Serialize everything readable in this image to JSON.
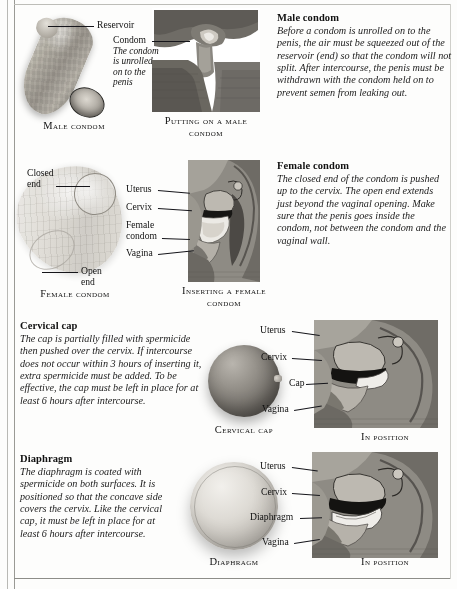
{
  "page": {
    "sections": [
      {
        "id": "male-condom",
        "heading": "Male condom",
        "body": "Before a condom is unrolled on to the penis, the air must be squeezed out of the reservoir (end) so that the condom will not split. After intercourse, the penis must be withdrawn with the condom held on to prevent semen from leaking out."
      },
      {
        "id": "female-condom",
        "heading": "Female condom",
        "body": "The closed end of the condom is pushed up to the cervix. The open end extends just beyond the vaginal opening. Make sure that the penis goes inside the condom, not between the condom and the vaginal wall."
      },
      {
        "id": "cervical-cap",
        "heading": "Cervical cap",
        "body": "The cap is partially filled with spermicide then pushed over the cervix. If intercourse does not occur within 3 hours of inserting it, extra spermicide must be added. To be effective, the cap must be left in place for at least 6 hours after intercourse."
      },
      {
        "id": "diaphragm",
        "heading": "Diaphragm",
        "body": "The diaphragm is coated with spermicide on both surfaces. It is positioned so that the concave side covers the cervix. Like the cervical cap, it must be left in place for at least 6 hours after intercourse."
      }
    ],
    "figure_captions": {
      "male_condom": "Male condom",
      "putting_on": "Putting on a male condom",
      "female_condom": "Female condom",
      "inserting_female": "Inserting a female condom",
      "cervical_cap": "Cervical cap",
      "cap_in_position": "In position",
      "diaphragm": "Diaphragm",
      "diaphragm_in_position": "In position"
    },
    "callouts": {
      "reservoir": "Reservoir",
      "condom": "Condom",
      "condom_note": "The condom is unrolled on to the penis",
      "closed_end": "Closed end",
      "open_end": "Open end",
      "uterus": "Uterus",
      "cervix": "Cervix",
      "female_condom": "Female condom",
      "vagina": "Vagina",
      "cap": "Cap",
      "diaphragm": "Diaphragm"
    },
    "colors": {
      "page_background": "#fdfdfc",
      "text": "#1a1a1a",
      "rule": "#9a9a95",
      "anatomy_mid_gray": "#8e8b84",
      "anatomy_dark": "#3b3935",
      "anatomy_light": "#d9d6cf"
    }
  }
}
